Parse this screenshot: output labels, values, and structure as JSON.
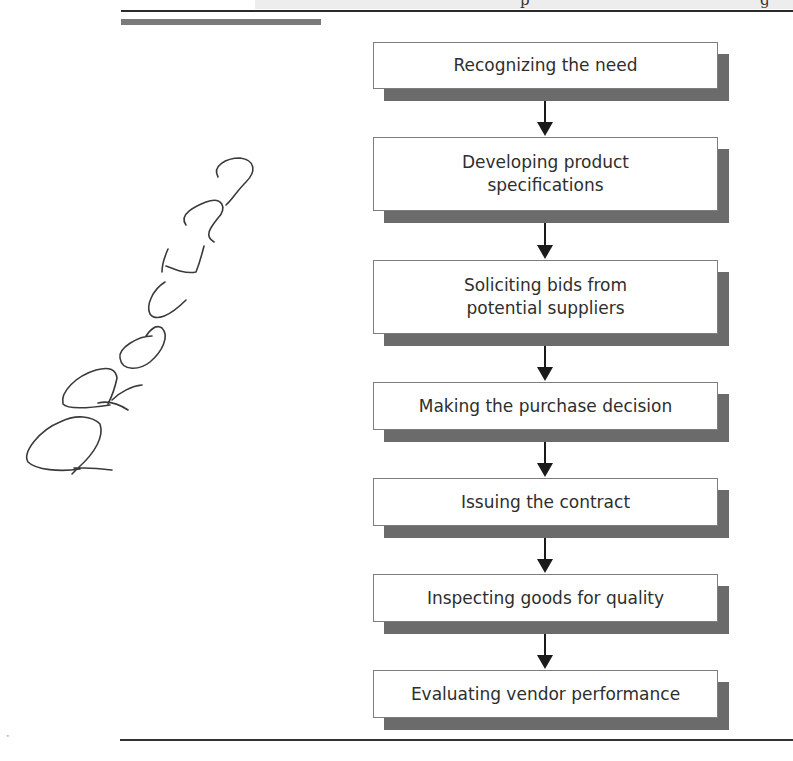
{
  "header": {
    "partial_glyphs": [
      "p",
      "g"
    ]
  },
  "handwritten_note": {
    "text": "PROCESS",
    "orientation": "diagonal, bottom-left to top-right"
  },
  "flowchart": {
    "type": "vertical process flow",
    "steps": [
      {
        "label": "Recognizing the need"
      },
      {
        "label": "Developing product specifications"
      },
      {
        "label": "Soliciting bids from potential suppliers"
      },
      {
        "label": "Making the purchase decision"
      },
      {
        "label": "Issuing the contract"
      },
      {
        "label": "Inspecting goods for quality"
      },
      {
        "label": "Evaluating vendor performance"
      }
    ],
    "connector": "down-arrow-icon"
  },
  "colors": {
    "shadow": "#6b6b6b",
    "border": "#7d7d7d",
    "text": "#2e2e2e",
    "arrow": "#1a1a1a",
    "accent_bar": "#7a7a7a"
  }
}
